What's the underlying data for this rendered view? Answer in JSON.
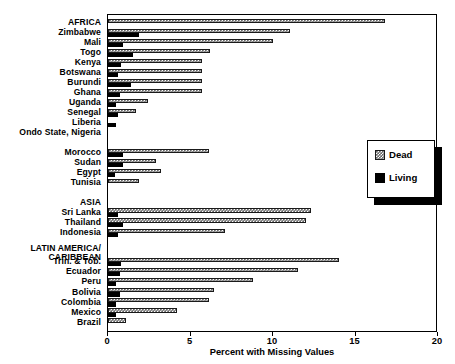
{
  "chart_data": {
    "type": "bar",
    "orientation": "horizontal",
    "title": "",
    "subtitle": "",
    "xlabel": "Percent with Missing Values",
    "ylabel": "",
    "xlim": [
      0,
      20
    ],
    "ylim": null,
    "xticks": [
      0,
      5,
      10,
      15,
      20
    ],
    "xtick_labels": [
      "0",
      "5",
      "10",
      "15",
      "20"
    ],
    "grid": false,
    "legend_position": "right-middle",
    "legend": [
      {
        "name": "Dead",
        "pattern": "hatched",
        "color": "#6a6a6a"
      },
      {
        "name": "Living",
        "pattern": "solid",
        "color": "#000000"
      }
    ],
    "series": [
      {
        "name": "Dead",
        "key": "dead"
      },
      {
        "name": "Living",
        "key": "living"
      }
    ],
    "groups": [
      {
        "name": "AFRICA",
        "categories": [
          {
            "label": "AFRICA",
            "is_header": true,
            "dead": 16.8,
            "living": 0.0
          },
          {
            "label": "Zimbabwe",
            "is_header": false,
            "dead": 11.0,
            "living": 1.9
          },
          {
            "label": "Mali",
            "is_header": false,
            "dead": 10.0,
            "living": 0.9
          },
          {
            "label": "Togo",
            "is_header": false,
            "dead": 6.2,
            "living": 1.5
          },
          {
            "label": "Kenya",
            "is_header": false,
            "dead": 5.7,
            "living": 0.8
          },
          {
            "label": "Botswana",
            "is_header": false,
            "dead": 5.7,
            "living": 0.6
          },
          {
            "label": "Burundi",
            "is_header": false,
            "dead": 5.7,
            "living": 1.4
          },
          {
            "label": "Ghana",
            "is_header": false,
            "dead": 5.7,
            "living": 0.7
          },
          {
            "label": "Uganda",
            "is_header": false,
            "dead": 2.4,
            "living": 0.5
          },
          {
            "label": "Senegal",
            "is_header": false,
            "dead": 1.7,
            "living": 0.6
          },
          {
            "label": "Liberia",
            "is_header": false,
            "dead": 0.0,
            "living": 0.5
          },
          {
            "label": "Ondo State, Nigeria",
            "is_header": false,
            "dead": 0.0,
            "living": 0.0
          }
        ]
      },
      {
        "name": "North Africa",
        "categories": [
          {
            "label": "Morocco",
            "is_header": false,
            "dead": 6.1,
            "living": 0.9
          },
          {
            "label": "Sudan",
            "is_header": false,
            "dead": 2.9,
            "living": 0.9
          },
          {
            "label": "Egypt",
            "is_header": false,
            "dead": 3.2,
            "living": 0.4
          },
          {
            "label": "Tunisia",
            "is_header": false,
            "dead": 1.9,
            "living": 0.0
          }
        ]
      },
      {
        "name": "ASIA",
        "categories": [
          {
            "label": "ASIA",
            "is_header": true,
            "dead": 0.0,
            "living": 0.0
          },
          {
            "label": "Sri Lanka",
            "is_header": false,
            "dead": 12.3,
            "living": 0.6
          },
          {
            "label": "Thailand",
            "is_header": false,
            "dead": 12.0,
            "living": 0.9
          },
          {
            "label": "Indonesia",
            "is_header": false,
            "dead": 7.1,
            "living": 0.6
          }
        ]
      },
      {
        "name": "LATIN AMERICA/CARIBBEAN",
        "categories": [
          {
            "label": "LATIN AMERICA/",
            "label2": "CARIBBEAN",
            "is_header": true,
            "dead": 0.0,
            "living": 0.0
          },
          {
            "label": "Trin. & Tob.",
            "is_header": false,
            "dead": 14.0,
            "living": 0.8
          },
          {
            "label": "Ecuador",
            "is_header": false,
            "dead": 11.5,
            "living": 0.7
          },
          {
            "label": "Peru",
            "is_header": false,
            "dead": 8.8,
            "living": 0.5
          },
          {
            "label": "Bolivia",
            "is_header": false,
            "dead": 6.4,
            "living": 0.7
          },
          {
            "label": "Colombia",
            "is_header": false,
            "dead": 6.1,
            "living": 0.5
          },
          {
            "label": "Mexico",
            "is_header": false,
            "dead": 4.2,
            "living": 0.5
          },
          {
            "label": "Brazil",
            "is_header": false,
            "dead": 1.1,
            "living": 0.0
          }
        ]
      }
    ]
  }
}
